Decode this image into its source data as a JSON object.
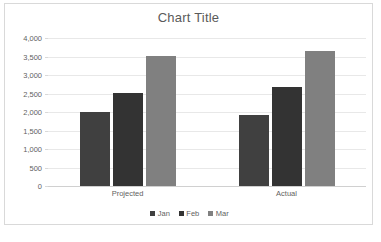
{
  "chart_data": {
    "type": "bar",
    "title": "Chart Title",
    "xlabel": "",
    "ylabel": "",
    "categories": [
      "Projected",
      "Actual"
    ],
    "series": [
      {
        "name": "Jan",
        "color": "#404040",
        "values": [
          2000,
          1930
        ]
      },
      {
        "name": "Feb",
        "color": "#333333",
        "values": [
          2520,
          2680
        ]
      },
      {
        "name": "Mar",
        "color": "#808080",
        "values": [
          3520,
          3660
        ]
      }
    ],
    "ylim": [
      0,
      4000
    ],
    "ytick_step": 500,
    "ytick_labels": [
      "4,000",
      "3,500",
      "3,000",
      "2,500",
      "2,000",
      "1,500",
      "1,000",
      "500",
      "0"
    ],
    "ytick_values": [
      4000,
      3500,
      3000,
      2500,
      2000,
      1500,
      1000,
      500,
      0
    ],
    "grid": true,
    "legend_position": "bottom",
    "grid_color": "#e8e8e8",
    "axis_color": "#d0d0d0",
    "text_color": "#5f5f5f",
    "title_color": "#5a5a5a",
    "plot_background": "#ffffff",
    "frame_border_color": "#d9d9d9"
  },
  "caption": {
    "text": ""
  }
}
